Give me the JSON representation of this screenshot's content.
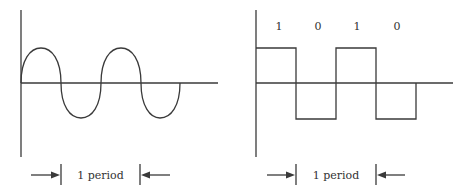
{
  "colors": {
    "stroke": "#3a3a3a",
    "background": "#ffffff"
  },
  "analog_panel": {
    "name": "sine-wave",
    "period_label": "1 period"
  },
  "digital_panel": {
    "name": "square-wave",
    "bits": [
      "1",
      "0",
      "1",
      "0"
    ],
    "period_label": "1 period"
  }
}
